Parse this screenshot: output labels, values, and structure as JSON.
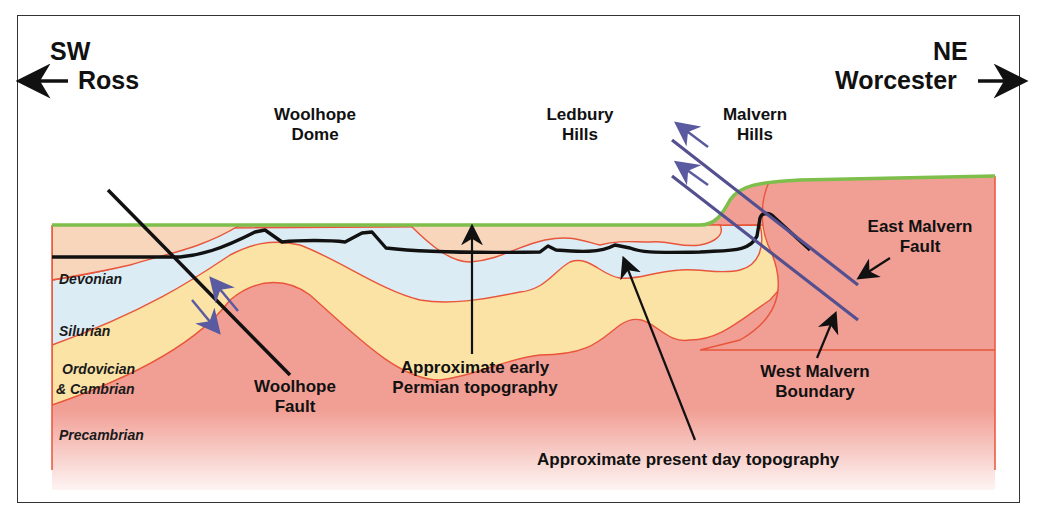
{
  "diagram": {
    "directions": {
      "left": {
        "compass": "SW",
        "place": "Ross",
        "arrow": "arrow-left"
      },
      "right": {
        "compass": "NE",
        "place": "Worcester",
        "arrow": "arrow-right"
      }
    },
    "features": {
      "woolhope_dome": "Woolhope\nDome",
      "woolhope_dome_l1": "Woolhope",
      "woolhope_dome_l2": "Dome",
      "ledbury_l1": "Ledbury",
      "ledbury_l2": "Hills",
      "malvern_l1": "Malvern",
      "malvern_l2": "Hills"
    },
    "strata": [
      {
        "name": "Devonian",
        "color": "#f8d6bc"
      },
      {
        "name": "Silurian",
        "color": "#dcecf4"
      },
      {
        "name": "Ordovician",
        "name2": "& Cambrian",
        "color": "#fbe3a6"
      },
      {
        "name": "Precambrian",
        "color": "#f19f95"
      }
    ],
    "annotations": {
      "woolhope_fault_l1": "Woolhope",
      "woolhope_fault_l2": "Fault",
      "permian_l1": "Approximate early",
      "permian_l2": "Permian topography",
      "present_day": "Approximate present day topography",
      "east_malvern_l1": "East Malvern",
      "east_malvern_l2": "Fault",
      "west_malvern_l1": "West Malvern",
      "west_malvern_l2": "Boundary"
    },
    "colors": {
      "surface_line": "#7dbf4a",
      "contact_lines": "#e8553a",
      "fault_lines_malvern": "#54508f",
      "motion_arrows": "#5a5aa0",
      "topography_line": "#111111"
    }
  }
}
